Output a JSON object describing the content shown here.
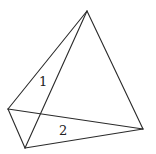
{
  "figure": {
    "type": "tetrahedron-line-drawing",
    "vertices": {
      "apex": [
        87,
        11
      ],
      "left": [
        8,
        109
      ],
      "bottom": [
        25,
        148
      ],
      "right": [
        143,
        129
      ]
    },
    "edges": [
      [
        "apex",
        "left"
      ],
      [
        "apex",
        "bottom"
      ],
      [
        "apex",
        "right"
      ],
      [
        "left",
        "bottom"
      ],
      [
        "left",
        "right"
      ],
      [
        "bottom",
        "right"
      ]
    ],
    "labels": [
      {
        "text": "1",
        "x": 39,
        "y": 86
      },
      {
        "text": "2",
        "x": 59,
        "y": 135
      }
    ],
    "stroke_color": "#2a2a2a"
  }
}
